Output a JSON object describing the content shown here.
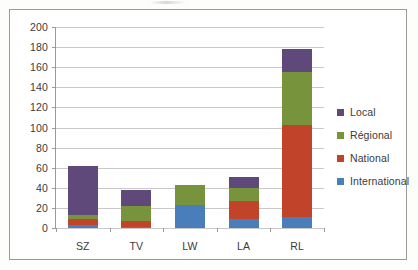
{
  "chart_data": {
    "type": "bar",
    "stacked": true,
    "title": "",
    "subtitle": "",
    "xlabel": "",
    "ylabel": "",
    "categories": [
      "SZ",
      "TV",
      "LW",
      "LA",
      "RL"
    ],
    "series": [
      {
        "name": "International",
        "color": "#4a7ebb",
        "values": [
          3,
          1,
          23,
          9,
          11
        ]
      },
      {
        "name": "National",
        "color": "#c0432a",
        "values": [
          6,
          6,
          0,
          18,
          92
        ]
      },
      {
        "name": "Régional",
        "color": "#77933c",
        "values": [
          4,
          15,
          20,
          13,
          52
        ]
      },
      {
        "name": "Local",
        "color": "#5f497a",
        "values": [
          49,
          16,
          0,
          11,
          23
        ]
      }
    ],
    "totals": [
      62,
      38,
      43,
      51,
      178
    ],
    "ylim": [
      0,
      200
    ],
    "ytick_step": 20,
    "ytick_labels": [
      "0",
      "20",
      "40",
      "60",
      "80",
      "100",
      "120",
      "140",
      "160",
      "180",
      "200"
    ],
    "grid": true,
    "legend_position": "right",
    "legend_order": [
      "Local",
      "Régional",
      "National",
      "International"
    ],
    "stack_order_bottom_to_top": [
      "International",
      "National",
      "Régional",
      "Local"
    ]
  },
  "legend": {
    "items": [
      {
        "label": "Local",
        "color": "#5f497a",
        "icon": "legend-swatch-icon"
      },
      {
        "label": "Régional",
        "color": "#77933c",
        "icon": "legend-swatch-icon"
      },
      {
        "label": "National",
        "color": "#c0432a",
        "icon": "legend-swatch-icon"
      },
      {
        "label": "International",
        "color": "#4a7ebb",
        "icon": "legend-swatch-icon"
      }
    ]
  },
  "colors": {
    "local": "#5f497a",
    "regional": "#77933c",
    "national": "#c0432a",
    "international": "#4a7ebb",
    "gridline": "#c9c9c9",
    "axis": "#9a9a9a",
    "text": "#3b3b3b",
    "frame": "#9a9a9a",
    "plot_background": "#ffffff"
  }
}
